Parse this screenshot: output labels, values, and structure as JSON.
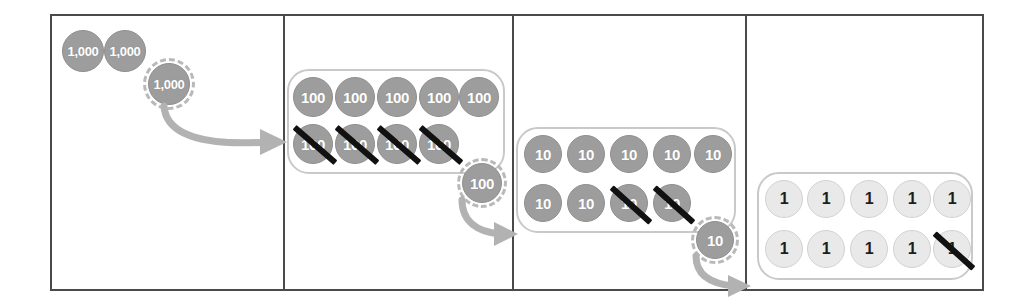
{
  "colors": {
    "chip_dark": "#9d9d9d",
    "chip_light": "#e9e9e9",
    "chip_dark_text": "#ffffff",
    "chip_light_text": "#1d1d1d",
    "group_outline": "#c9c9c9",
    "dashed_outline": "#b9b9b9",
    "arrow": "#b0b0b0",
    "strike": "#111111",
    "frame_border": "#4a4a4a"
  },
  "panels": [
    {
      "name": "thousands-panel",
      "place_value": "1,000",
      "chips": [
        {
          "label": "1,000",
          "style": "dark",
          "struck": false,
          "dashed": false
        },
        {
          "label": "1,000",
          "style": "dark",
          "struck": false,
          "dashed": false
        },
        {
          "label": "1,000",
          "style": "dark",
          "struck": false,
          "dashed": true
        }
      ],
      "grouped": false,
      "arrow_to_next": true
    },
    {
      "name": "hundreds-panel",
      "place_value": "100",
      "grouped": true,
      "rows": [
        [
          {
            "label": "100",
            "style": "dark",
            "struck": false
          },
          {
            "label": "100",
            "style": "dark",
            "struck": false
          },
          {
            "label": "100",
            "style": "dark",
            "struck": false
          },
          {
            "label": "100",
            "style": "dark",
            "struck": false
          },
          {
            "label": "100",
            "style": "dark",
            "struck": false
          }
        ],
        [
          {
            "label": "100",
            "style": "dark",
            "struck": true
          },
          {
            "label": "100",
            "style": "dark",
            "struck": true
          },
          {
            "label": "100",
            "style": "dark",
            "struck": true
          },
          {
            "label": "100",
            "style": "dark",
            "struck": true
          }
        ]
      ],
      "moving_chip": {
        "label": "100",
        "style": "dark",
        "dashed": true
      },
      "arrow_to_next": true
    },
    {
      "name": "tens-panel",
      "place_value": "10",
      "grouped": true,
      "rows": [
        [
          {
            "label": "10",
            "style": "dark",
            "struck": false
          },
          {
            "label": "10",
            "style": "dark",
            "struck": false
          },
          {
            "label": "10",
            "style": "dark",
            "struck": false
          },
          {
            "label": "10",
            "style": "dark",
            "struck": false
          },
          {
            "label": "10",
            "style": "dark",
            "struck": false
          }
        ],
        [
          {
            "label": "10",
            "style": "dark",
            "struck": false
          },
          {
            "label": "10",
            "style": "dark",
            "struck": false
          },
          {
            "label": "10",
            "style": "dark",
            "struck": true
          },
          {
            "label": "10",
            "style": "dark",
            "struck": true
          }
        ]
      ],
      "moving_chip": {
        "label": "10",
        "style": "dark",
        "dashed": true
      },
      "arrow_to_next": true
    },
    {
      "name": "ones-panel",
      "place_value": "1",
      "grouped": true,
      "rows": [
        [
          {
            "label": "1",
            "style": "light",
            "struck": false
          },
          {
            "label": "1",
            "style": "light",
            "struck": false
          },
          {
            "label": "1",
            "style": "light",
            "struck": false
          },
          {
            "label": "1",
            "style": "light",
            "struck": false
          },
          {
            "label": "1",
            "style": "light",
            "struck": false
          }
        ],
        [
          {
            "label": "1",
            "style": "light",
            "struck": false
          },
          {
            "label": "1",
            "style": "light",
            "struck": false
          },
          {
            "label": "1",
            "style": "light",
            "struck": false
          },
          {
            "label": "1",
            "style": "light",
            "struck": false
          },
          {
            "label": "1",
            "style": "light",
            "struck": true
          }
        ]
      ],
      "moving_chip": null,
      "arrow_to_next": false
    }
  ]
}
